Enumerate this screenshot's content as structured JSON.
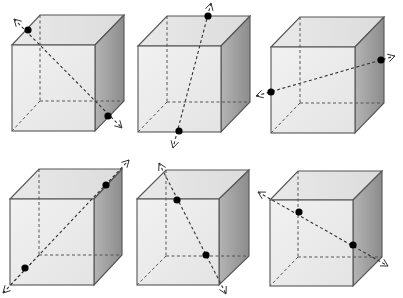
{
  "figure": {
    "colors": {
      "front_face": "#ececec",
      "top_face": "#e2e2e2",
      "side_face": "#9a9a9a",
      "edges": "#555555",
      "dots": "#000000"
    },
    "cubes": [
      {
        "id": 1,
        "row": 1,
        "col": 1,
        "axis": "body diagonal: back-top-left to front-bottom-right",
        "front": [
          12,
          45,
          95,
          131
        ],
        "back": [
          40,
          15,
          124,
          101
        ],
        "dots": [
          [
            28,
            30
          ],
          [
            108,
            116
          ]
        ],
        "ends": [
          [
            14,
            19
          ],
          [
            122,
            128
          ]
        ]
      },
      {
        "id": 2,
        "row": 1,
        "col": 2,
        "axis": "top-back edge point to bottom-front edge point",
        "front": [
          138,
          46,
          221,
          132
        ],
        "back": [
          167,
          16,
          250,
          102
        ],
        "dots": [
          [
            208,
            16
          ],
          [
            179,
            131
          ]
        ],
        "ends": [
          [
            211,
            3
          ],
          [
            173,
            148
          ]
        ]
      },
      {
        "id": 3,
        "row": 1,
        "col": 3,
        "axis": "left-face point to right-face point",
        "front": [
          271,
          47,
          355,
          133
        ],
        "back": [
          300,
          17,
          384,
          103
        ],
        "dots": [
          [
            271,
            92
          ],
          [
            381,
            60
          ]
        ],
        "ends": [
          [
            256,
            96
          ],
          [
            395,
            56
          ]
        ]
      },
      {
        "id": 4,
        "row": 2,
        "col": 1,
        "axis": "body diagonal: front-bottom-left to back-top-right",
        "front": [
          10,
          199,
          94,
          285
        ],
        "back": [
          39,
          169,
          122,
          255
        ],
        "dots": [
          [
            25,
            268
          ],
          [
            106,
            185
          ]
        ],
        "ends": [
          [
            3,
            293
          ],
          [
            129,
            160
          ]
        ]
      },
      {
        "id": 5,
        "row": 2,
        "col": 2,
        "axis": "back-top-left corner to front-bottom-right corner",
        "front": [
          137,
          199,
          219,
          285
        ],
        "back": [
          166,
          170,
          249,
          256
        ],
        "dots": [
          [
            177,
            200
          ],
          [
            206,
            255
          ]
        ],
        "ends": [
          [
            159,
            163
          ],
          [
            226,
            294
          ]
        ]
      },
      {
        "id": 6,
        "row": 2,
        "col": 3,
        "axis": "front-top-left corner to back-bottom-right corner",
        "front": [
          270,
          200,
          353,
          286
        ],
        "back": [
          298,
          171,
          382,
          257
        ],
        "dots": [
          [
            299,
            212
          ],
          [
            353,
            245
          ]
        ],
        "ends": [
          [
            258,
            192
          ],
          [
            388,
            266
          ]
        ]
      }
    ]
  }
}
